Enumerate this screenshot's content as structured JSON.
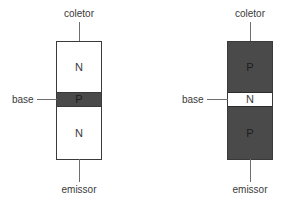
{
  "colors": {
    "background": "#ffffff",
    "semiconductor_dark": "#4a4a4a",
    "semiconductor_light": "#ffffff",
    "outline": "#3a3a3a",
    "lead_line": "#6e6e6e",
    "label_text": "#3a3a3a"
  },
  "diagrams": [
    {
      "id": "npn",
      "terminals": {
        "collector": "coletor",
        "base": "base",
        "emitter": "emissor"
      },
      "layers": [
        {
          "label": "N",
          "shade": "light"
        },
        {
          "label": "P",
          "shade": "dark"
        },
        {
          "label": "N",
          "shade": "light"
        }
      ]
    },
    {
      "id": "pnp",
      "terminals": {
        "collector": "coletor",
        "base": "base",
        "emitter": "emissor"
      },
      "layers": [
        {
          "label": "P",
          "shade": "dark"
        },
        {
          "label": "N",
          "shade": "light"
        },
        {
          "label": "P",
          "shade": "dark"
        }
      ]
    }
  ]
}
